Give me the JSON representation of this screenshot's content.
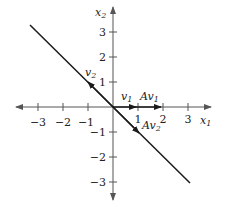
{
  "diagram": {
    "axes": {
      "x_label": "x",
      "x_sub": "1",
      "y_label": "x",
      "y_sub": "2",
      "x_ticks": [
        "−3",
        "−2",
        "−1",
        "1",
        "2",
        "3"
      ],
      "y_ticks": [
        "3",
        "2",
        "1",
        "−1",
        "−2",
        "−3"
      ]
    },
    "vectors": {
      "v1": {
        "label": "v",
        "sub": "1"
      },
      "Av1": {
        "label": "Av",
        "sub": "1"
      },
      "v2": {
        "label": "v",
        "sub": "2"
      },
      "Av2": {
        "label": "Av",
        "sub": "2"
      }
    },
    "colors": {
      "axis": "#555555",
      "line": "#1a1a1a"
    }
  }
}
